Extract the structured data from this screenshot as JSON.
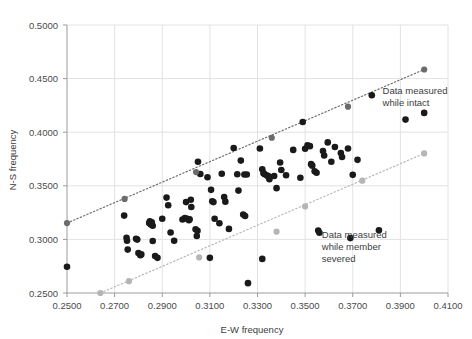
{
  "chart_data": {
    "type": "scatter",
    "title": "",
    "xlabel": "E-W frequency",
    "ylabel": "N-S frequency",
    "xlim": [
      0.25,
      0.41
    ],
    "ylim": [
      0.25,
      0.5
    ],
    "xticks": [
      "0.2500",
      "0.2700",
      "0.2900",
      "0.3100",
      "0.3300",
      "0.3500",
      "0.3700",
      "0.3900",
      "0.4100"
    ],
    "yticks": [
      "0.2500",
      "0.3000",
      "0.3500",
      "0.4000",
      "0.4500",
      "0.5000"
    ],
    "xtick_values": [
      0.25,
      0.27,
      0.29,
      0.31,
      0.33,
      0.35,
      0.37,
      0.39,
      0.41
    ],
    "ytick_values": [
      0.25,
      0.3,
      0.35,
      0.4,
      0.45,
      0.5
    ],
    "grid": true,
    "legend_position": "inside-right",
    "series": [
      {
        "name": "Data measured while intact",
        "marker": "filled-circle",
        "color": "#1a1a1a",
        "points": [
          [
            0.25,
            0.2745
          ],
          [
            0.274,
            0.3222
          ],
          [
            0.275,
            0.3015
          ],
          [
            0.2752,
            0.2988
          ],
          [
            0.2755,
            0.2905
          ],
          [
            0.2845,
            0.3152
          ],
          [
            0.2848,
            0.3168
          ],
          [
            0.2852,
            0.314
          ],
          [
            0.2856,
            0.316
          ],
          [
            0.286,
            0.3128
          ],
          [
            0.28,
            0.2872
          ],
          [
            0.2808,
            0.2852
          ],
          [
            0.2812,
            0.286
          ],
          [
            0.29,
            0.3192
          ],
          [
            0.2918,
            0.339
          ],
          [
            0.2925,
            0.3318
          ],
          [
            0.2935,
            0.3065
          ],
          [
            0.286,
            0.2985
          ],
          [
            0.288,
            0.2828
          ],
          [
            0.2985,
            0.3185
          ],
          [
            0.2995,
            0.32
          ],
          [
            0.3,
            0.3348
          ],
          [
            0.3005,
            0.3192
          ],
          [
            0.3012,
            0.3178
          ],
          [
            0.3015,
            0.3188
          ],
          [
            0.302,
            0.337
          ],
          [
            0.3022,
            0.3302
          ],
          [
            0.304,
            0.3095
          ],
          [
            0.3048,
            0.308
          ],
          [
            0.3045,
            0.3032
          ],
          [
            0.305,
            0.3725
          ],
          [
            0.306,
            0.361
          ],
          [
            0.309,
            0.358
          ],
          [
            0.3105,
            0.3462
          ],
          [
            0.311,
            0.3355
          ],
          [
            0.3115,
            0.3348
          ],
          [
            0.312,
            0.3192
          ],
          [
            0.314,
            0.315
          ],
          [
            0.315,
            0.3612
          ],
          [
            0.316,
            0.3395
          ],
          [
            0.3165,
            0.3352
          ],
          [
            0.318,
            0.3098
          ],
          [
            0.31,
            0.2828
          ],
          [
            0.32,
            0.3852
          ],
          [
            0.3215,
            0.3608
          ],
          [
            0.322,
            0.3455
          ],
          [
            0.323,
            0.3735
          ],
          [
            0.3245,
            0.3605
          ],
          [
            0.3255,
            0.3605
          ],
          [
            0.324,
            0.3232
          ],
          [
            0.3248,
            0.3218
          ],
          [
            0.326,
            0.2592
          ],
          [
            0.331,
            0.3848
          ],
          [
            0.332,
            0.3655
          ],
          [
            0.3325,
            0.3618
          ],
          [
            0.333,
            0.3608
          ],
          [
            0.334,
            0.3595
          ],
          [
            0.3345,
            0.359
          ],
          [
            0.335,
            0.3562
          ],
          [
            0.337,
            0.3592
          ],
          [
            0.332,
            0.2818
          ],
          [
            0.338,
            0.3478
          ],
          [
            0.3395,
            0.3718
          ],
          [
            0.34,
            0.3648
          ],
          [
            0.342,
            0.3598
          ],
          [
            0.345,
            0.3835
          ],
          [
            0.348,
            0.3575
          ],
          [
            0.349,
            0.4095
          ],
          [
            0.35,
            0.3845
          ],
          [
            0.351,
            0.3878
          ],
          [
            0.352,
            0.387
          ],
          [
            0.3525,
            0.3702
          ],
          [
            0.353,
            0.3688
          ],
          [
            0.354,
            0.3635
          ],
          [
            0.3548,
            0.3622
          ],
          [
            0.3555,
            0.3082
          ],
          [
            0.356,
            0.3062
          ],
          [
            0.3575,
            0.3825
          ],
          [
            0.358,
            0.3782
          ],
          [
            0.3595,
            0.3905
          ],
          [
            0.361,
            0.3725
          ],
          [
            0.3625,
            0.3862
          ],
          [
            0.365,
            0.3805
          ],
          [
            0.3655,
            0.3768
          ],
          [
            0.368,
            0.3848
          ],
          [
            0.369,
            0.3012
          ],
          [
            0.37,
            0.3602
          ],
          [
            0.372,
            0.3742
          ],
          [
            0.378,
            0.4345
          ],
          [
            0.381,
            0.3085
          ],
          [
            0.4,
            0.418
          ],
          [
            0.279,
            0.3005
          ],
          [
            0.2795,
            0.2998
          ],
          [
            0.295,
            0.2988
          ],
          [
            0.287,
            0.2845
          ]
        ]
      },
      {
        "name": "Intact trend line (dark dotted)",
        "marker": "gray-circle",
        "color": "#6b6b6b",
        "line_style": "dotted",
        "points": [
          [
            0.25,
            0.3152
          ],
          [
            0.2742,
            0.3378
          ],
          [
            0.3042,
            0.3628
          ],
          [
            0.336,
            0.3948
          ],
          [
            0.368,
            0.4238
          ],
          [
            0.4,
            0.4585
          ]
        ]
      },
      {
        "name": "Severed trend line (light dotted)",
        "marker": "light-gray-circle",
        "color": "#b5b5b5",
        "line_style": "dotted",
        "points": [
          [
            0.264,
            0.25
          ],
          [
            0.276,
            0.261
          ],
          [
            0.3055,
            0.2832
          ],
          [
            0.338,
            0.3072
          ],
          [
            0.35,
            0.3308
          ],
          [
            0.374,
            0.3548
          ],
          [
            0.4,
            0.3802
          ]
        ]
      }
    ],
    "annotations": [
      {
        "id": "annotation-intact",
        "lines": [
          "Data measured",
          "while intact"
        ],
        "marker": "filled-circle",
        "x": 0.3825,
        "y": 0.436
      },
      {
        "id": "annotation-severed",
        "lines": [
          "Data measured",
          "while member",
          "severed"
        ],
        "marker": "none",
        "x": 0.357,
        "y": 0.301
      }
    ],
    "colors": {
      "point_dark": "#1a1a1a",
      "point_gray": "#6b6b6b",
      "point_light_gray": "#b5b5b5",
      "grid": "#e2e2e2",
      "axis": "#9a9a9a",
      "text": "#3d3d3d",
      "background": "#ffffff"
    }
  }
}
